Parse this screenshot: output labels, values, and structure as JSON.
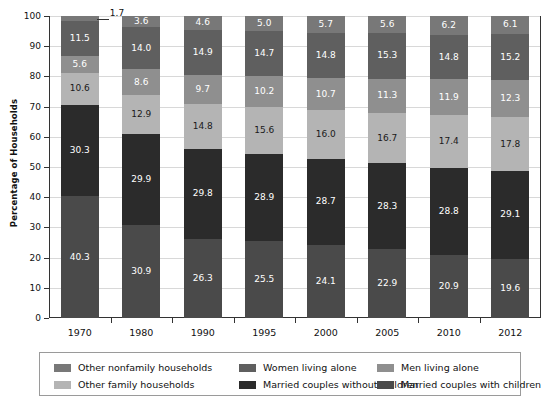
{
  "chart_data": {
    "type": "bar",
    "subtype": "stacked-bar-100",
    "title": "",
    "xlabel": "",
    "ylabel": "Percentage of Households",
    "ylim": [
      0,
      100
    ],
    "yticks": [
      0,
      10,
      20,
      30,
      40,
      50,
      60,
      70,
      80,
      90,
      100
    ],
    "grid": true,
    "legend_position": "bottom",
    "categories": [
      "1970",
      "1980",
      "1990",
      "1995",
      "2000",
      "2005",
      "2010",
      "2012"
    ],
    "series": [
      {
        "name": "Married couples with children",
        "color": "#4a4a4a",
        "label_color": "#ffffff",
        "values": [
          40.3,
          30.9,
          26.3,
          25.5,
          24.1,
          22.9,
          20.9,
          19.6
        ]
      },
      {
        "name": "Married couples without children",
        "color": "#2b2b2b",
        "label_color": "#ffffff",
        "values": [
          30.3,
          29.9,
          29.8,
          28.9,
          28.7,
          28.3,
          28.8,
          29.1
        ]
      },
      {
        "name": "Other family households",
        "color": "#b4b4b4",
        "label_color": "#1a1a1a",
        "values": [
          10.6,
          12.9,
          14.8,
          15.6,
          16.0,
          16.7,
          17.4,
          17.8
        ]
      },
      {
        "name": "Men living alone",
        "color": "#8f8f8f",
        "label_color": "#ffffff",
        "values": [
          5.6,
          8.6,
          9.7,
          10.2,
          10.7,
          11.3,
          11.9,
          12.3
        ]
      },
      {
        "name": "Women living alone",
        "color": "#5f5f5f",
        "label_color": "#ffffff",
        "values": [
          11.5,
          14.0,
          14.9,
          14.7,
          14.8,
          15.3,
          14.8,
          15.2
        ]
      },
      {
        "name": "Other nonfamily households",
        "color": "#787878",
        "label_color": "#ffffff",
        "values": [
          1.7,
          3.6,
          4.6,
          5.0,
          5.7,
          5.6,
          6.2,
          6.1
        ]
      }
    ],
    "annotations": [
      {
        "name": "callout-1970-other-nonfamily",
        "text": "1.7",
        "category": "1970",
        "series": "Other nonfamily households"
      }
    ]
  },
  "legend": {
    "rows": [
      [
        {
          "label": "Other nonfamily households",
          "color": "#787878"
        },
        {
          "label": "Women living alone",
          "color": "#5f5f5f"
        },
        {
          "label": "Men living alone",
          "color": "#8f8f8f"
        }
      ],
      [
        {
          "label": "Other family households",
          "color": "#b4b4b4"
        },
        {
          "label": "Married couples without children",
          "color": "#2b2b2b"
        },
        {
          "label": "Married couples with children",
          "color": "#4a4a4a"
        }
      ]
    ]
  }
}
